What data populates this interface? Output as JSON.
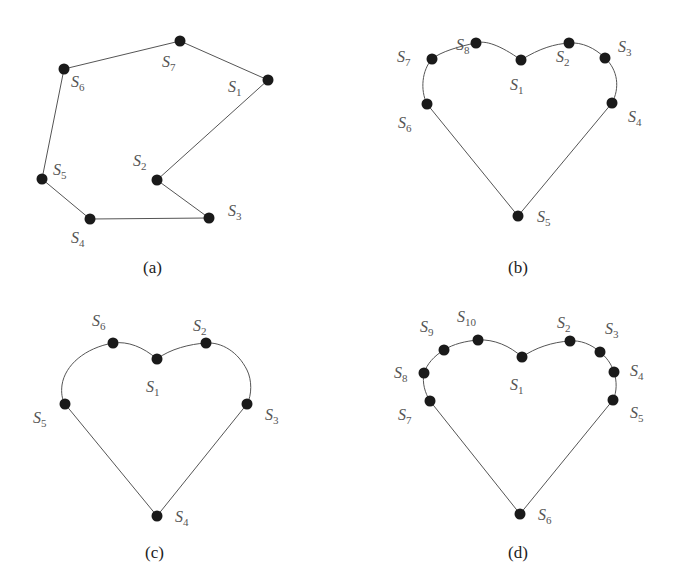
{
  "figure": {
    "panels": [
      {
        "id": "a",
        "caption": "(a)",
        "shape": "polygon",
        "nodes": [
          {
            "label": "S",
            "sub": "1",
            "x": 268,
            "y": 80,
            "lx": 228,
            "ly": 92
          },
          {
            "label": "S",
            "sub": "2",
            "x": 157,
            "y": 180,
            "lx": 133,
            "ly": 166
          },
          {
            "label": "S",
            "sub": "3",
            "x": 209,
            "y": 218,
            "lx": 228,
            "ly": 216
          },
          {
            "label": "S",
            "sub": "4",
            "x": 90,
            "y": 219,
            "lx": 71,
            "ly": 243
          },
          {
            "label": "S",
            "sub": "5",
            "x": 42,
            "y": 179,
            "lx": 53,
            "ly": 175
          },
          {
            "label": "S",
            "sub": "6",
            "x": 64,
            "y": 69,
            "lx": 71,
            "ly": 87
          },
          {
            "label": "S",
            "sub": "7",
            "x": 180,
            "y": 41,
            "lx": 162,
            "ly": 67
          }
        ]
      },
      {
        "id": "b",
        "caption": "(b)",
        "shape": "heart",
        "nodes": [
          {
            "label": "S",
            "sub": "1",
            "x": 521,
            "y": 60,
            "lx": 510,
            "ly": 90
          },
          {
            "label": "S",
            "sub": "2",
            "x": 569,
            "y": 43,
            "lx": 556,
            "ly": 62
          },
          {
            "label": "S",
            "sub": "3",
            "x": 605,
            "y": 58,
            "lx": 618,
            "ly": 52
          },
          {
            "label": "S",
            "sub": "4",
            "x": 612,
            "y": 103,
            "lx": 628,
            "ly": 122
          },
          {
            "label": "S",
            "sub": "5",
            "x": 518,
            "y": 216,
            "lx": 537,
            "ly": 222
          },
          {
            "label": "S",
            "sub": "6",
            "x": 427,
            "y": 104,
            "lx": 398,
            "ly": 128
          },
          {
            "label": "S",
            "sub": "7",
            "x": 432,
            "y": 59,
            "lx": 397,
            "ly": 62
          },
          {
            "label": "S",
            "sub": "8",
            "x": 476,
            "y": 43,
            "lx": 456,
            "ly": 50
          }
        ]
      },
      {
        "id": "c",
        "caption": "(c)",
        "shape": "heart",
        "nodes": [
          {
            "label": "S",
            "sub": "1",
            "x": 157,
            "y": 359,
            "lx": 146,
            "ly": 392
          },
          {
            "label": "S",
            "sub": "2",
            "x": 206,
            "y": 343,
            "lx": 193,
            "ly": 331
          },
          {
            "label": "S",
            "sub": "3",
            "x": 247,
            "y": 404,
            "lx": 265,
            "ly": 420
          },
          {
            "label": "S",
            "sub": "4",
            "x": 157,
            "y": 516,
            "lx": 175,
            "ly": 522
          },
          {
            "label": "S",
            "sub": "5",
            "x": 65,
            "y": 404,
            "lx": 33,
            "ly": 423
          },
          {
            "label": "S",
            "sub": "6",
            "x": 113,
            "y": 343,
            "lx": 92,
            "ly": 326
          }
        ]
      },
      {
        "id": "d",
        "caption": "(d)",
        "shape": "heart",
        "nodes": [
          {
            "label": "S",
            "sub": "1",
            "x": 522,
            "y": 357,
            "lx": 510,
            "ly": 390
          },
          {
            "label": "S",
            "sub": "2",
            "x": 570,
            "y": 341,
            "lx": 557,
            "ly": 328
          },
          {
            "label": "S",
            "sub": "3",
            "x": 600,
            "y": 352,
            "lx": 605,
            "ly": 334
          },
          {
            "label": "S",
            "sub": "4",
            "x": 614,
            "y": 372,
            "lx": 630,
            "ly": 376
          },
          {
            "label": "S",
            "sub": "5",
            "x": 613,
            "y": 400,
            "lx": 630,
            "ly": 418
          },
          {
            "label": "S",
            "sub": "6",
            "x": 520,
            "y": 514,
            "lx": 538,
            "ly": 520
          },
          {
            "label": "S",
            "sub": "7",
            "x": 430,
            "y": 401,
            "lx": 398,
            "ly": 420
          },
          {
            "label": "S",
            "sub": "8",
            "x": 424,
            "y": 373,
            "lx": 394,
            "ly": 378
          },
          {
            "label": "S",
            "sub": "9",
            "x": 444,
            "y": 350,
            "lx": 420,
            "ly": 332
          },
          {
            "label": "S",
            "sub": "10",
            "x": 478,
            "y": 340,
            "lx": 457,
            "ly": 322
          }
        ]
      }
    ]
  }
}
